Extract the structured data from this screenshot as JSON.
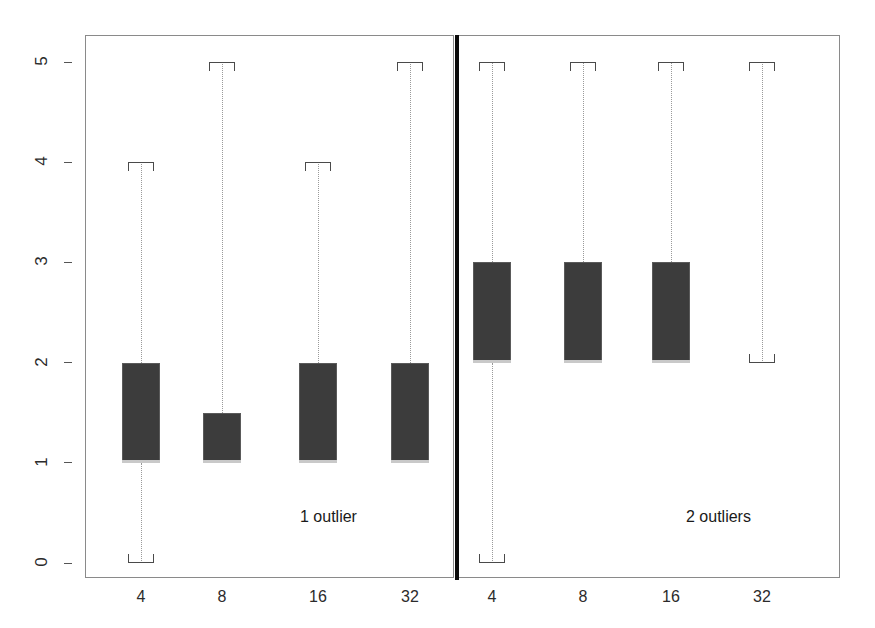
{
  "chart_data": {
    "type": "box",
    "title": "",
    "xlabel": "",
    "ylabel": "",
    "ylim": [
      0,
      5
    ],
    "yticks": [
      0,
      1,
      2,
      3,
      4,
      5
    ],
    "ytick_labels": [
      "0",
      "1",
      "2",
      "3",
      "4",
      "5"
    ],
    "grid": false,
    "legend": "none",
    "categories": [
      "4",
      "8",
      "16",
      "32"
    ],
    "panels": [
      {
        "note": "1 outlier",
        "boxes": [
          {
            "category": "4",
            "whisker_low": 0,
            "q1": 1,
            "median": 1,
            "q3": 2,
            "whisker_high": 4,
            "has_lower_cap": true,
            "has_upper_cap": true
          },
          {
            "category": "8",
            "whisker_low": 1,
            "q1": 1,
            "median": 1,
            "q3": 1.5,
            "whisker_high": 5,
            "has_lower_cap": false,
            "has_upper_cap": true
          },
          {
            "category": "16",
            "whisker_low": 1,
            "q1": 1,
            "median": 1,
            "q3": 2,
            "whisker_high": 4,
            "has_lower_cap": false,
            "has_upper_cap": true
          },
          {
            "category": "32",
            "whisker_low": 1,
            "q1": 1,
            "median": 1,
            "q3": 2,
            "whisker_high": 5,
            "has_lower_cap": false,
            "has_upper_cap": true
          }
        ]
      },
      {
        "note": "2 outliers",
        "boxes": [
          {
            "category": "4",
            "whisker_low": 0,
            "q1": 2,
            "median": 2,
            "q3": 3,
            "whisker_high": 5,
            "has_lower_cap": true,
            "has_upper_cap": true
          },
          {
            "category": "8",
            "whisker_low": 2,
            "q1": 2,
            "median": 2,
            "q3": 3,
            "whisker_high": 5,
            "has_lower_cap": false,
            "has_upper_cap": true
          },
          {
            "category": "16",
            "whisker_low": 2,
            "q1": 2,
            "median": 2,
            "q3": 3,
            "whisker_high": 5,
            "has_lower_cap": false,
            "has_upper_cap": true
          },
          {
            "category": "32",
            "whisker_low": 2,
            "q1": 2,
            "median": 2,
            "q3": 2,
            "whisker_high": 5,
            "has_lower_cap": true,
            "has_upper_cap": true
          }
        ]
      }
    ],
    "colors": {
      "box_fill": "#3c3c3c",
      "box_edge": "#5a5a5a",
      "median": "#c9c9c9",
      "whisker": "#9a9a9a",
      "frame": "#8a8a8a",
      "divider": "#0a0a0a",
      "text": "#1a1a1a"
    }
  },
  "geometry": {
    "y0_px": 563,
    "y5_px": 62,
    "panels": [
      {
        "left": 85,
        "right": 454,
        "centers": [
          141,
          222,
          318,
          410
        ],
        "note_x": 300,
        "note_y": 508
      },
      {
        "left": 457,
        "right": 840,
        "centers": [
          492,
          583,
          671,
          762
        ],
        "note_x": 686,
        "note_y": 508
      }
    ],
    "box_width": 38,
    "cap_width": 26,
    "axis_top": 35,
    "axis_bottom": 578,
    "xlabel_y": 588,
    "ytick_x": 64,
    "ylabel_x": 30
  }
}
